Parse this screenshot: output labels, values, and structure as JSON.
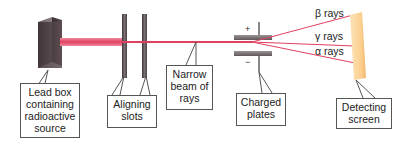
{
  "diagram": {
    "colors": {
      "beam": "#e8506e",
      "lead_box": "#4a3c40",
      "slots": "#5a5056",
      "plates": "#807878",
      "screen": "#fbcf8e"
    },
    "callouts": {
      "lead_box": [
        "Lead box",
        "containing",
        "radioactive",
        "source"
      ],
      "aligning_slots": [
        "Aligning",
        "slots"
      ],
      "narrow_beam": [
        "Narrow",
        "beam of",
        "rays"
      ],
      "charged_plates": [
        "Charged",
        "plates"
      ],
      "detecting_screen": [
        "Detecting",
        "screen"
      ]
    },
    "rays": {
      "beta": "β rays",
      "gamma": "γ rays",
      "alpha": "α rays"
    },
    "plate_signs": {
      "top": "+",
      "bottom": "−"
    }
  }
}
